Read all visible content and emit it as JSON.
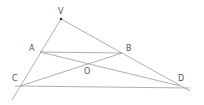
{
  "diagram": {
    "type": "geometry",
    "line_color": "#9a9a9a",
    "label_color": "#555555",
    "points": {
      "V": {
        "label": "V",
        "x": 61,
        "y": 19,
        "lx": 58,
        "ly": 14
      },
      "A": {
        "label": "A",
        "x": 40,
        "y": 52,
        "lx": 29,
        "ly": 51
      },
      "B": {
        "label": "B",
        "x": 122,
        "y": 53,
        "lx": 126,
        "ly": 51
      },
      "O": {
        "label": "O",
        "x": 88,
        "y": 64,
        "lx": 84,
        "ly": 74
      },
      "C": {
        "label": "C",
        "x": 20,
        "y": 86,
        "lx": 12,
        "ly": 81
      },
      "D": {
        "label": "D",
        "x": 180,
        "y": 86,
        "lx": 178,
        "ly": 81
      }
    },
    "segments": [
      {
        "name": "line-VC",
        "from": "V",
        "to": "C",
        "x1": 61,
        "y1": 19,
        "x2": 12,
        "y2": 100
      },
      {
        "name": "line-VD",
        "from": "V",
        "to": "D",
        "x1": 61,
        "y1": 19,
        "x2": 190,
        "y2": 91
      },
      {
        "name": "line-AB",
        "from": "A",
        "to": "B",
        "x1": 40,
        "y1": 52,
        "x2": 122,
        "y2": 53
      },
      {
        "name": "line-CD",
        "from": "C",
        "to": "D",
        "x1": 15,
        "y1": 86,
        "x2": 190,
        "y2": 88
      },
      {
        "name": "line-AD",
        "from": "A",
        "to": "D",
        "x1": 40,
        "y1": 52,
        "x2": 180,
        "y2": 86
      },
      {
        "name": "line-CB",
        "from": "C",
        "to": "B",
        "x1": 20,
        "y1": 86,
        "x2": 122,
        "y2": 53
      }
    ]
  }
}
